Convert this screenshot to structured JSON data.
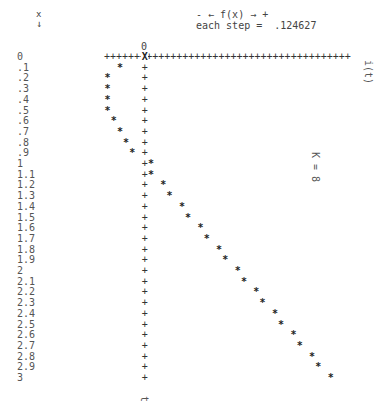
{
  "header": {
    "x_label": "x",
    "x_arrow": "↓",
    "direction_legend": "- ← f(x) → +",
    "step_text": "each step =  .124627"
  },
  "axis": {
    "zero_label": "0",
    "axis_line": "+++++++++++++++++++++++++++++++++++++++++",
    "right_label": "i(t)",
    "bottom_label": "t",
    "param_label": "K = 8"
  },
  "chart_data": {
    "type": "scatter",
    "title": "",
    "xlabel": "x (t)",
    "ylabel": "f(x) = i(t)",
    "step": 0.124627,
    "param": "K = 8",
    "orientation": "x vertical (down), f(x) horizontal (right)",
    "x": [
      0,
      0.1,
      0.2,
      0.3,
      0.4,
      0.5,
      0.6,
      0.7,
      0.8,
      0.9,
      1,
      1.1,
      1.2,
      1.3,
      1.4,
      1.5,
      1.6,
      1.7,
      1.8,
      1.9,
      2,
      2.1,
      2.2,
      2.3,
      2.4,
      2.5,
      2.6,
      2.7,
      2.8,
      2.9,
      3
    ],
    "x_labels": [
      "0",
      ".1",
      ".2",
      ".3",
      ".4",
      ".5",
      ".6",
      ".7",
      ".8",
      ".9",
      "1",
      "1.1",
      "1.2",
      "1.3",
      "1.4",
      "1.5",
      "1.6",
      "1.7",
      "1.8",
      "1.9",
      "2",
      "2.1",
      "2.2",
      "2.3",
      "2.4",
      "2.5",
      "2.6",
      "2.7",
      "2.8",
      "2.9",
      "3"
    ],
    "steps_from_axis": [
      0,
      -4,
      -6,
      -6,
      -6,
      -6,
      -5,
      -4,
      -3,
      -2,
      1,
      1,
      3,
      4,
      6,
      7,
      9,
      10,
      12,
      13,
      15,
      16,
      18,
      19,
      21,
      22,
      24,
      25,
      27,
      28,
      30
    ],
    "values": [
      0,
      -0.4985,
      -0.7478,
      -0.7478,
      -0.7478,
      -0.7478,
      -0.6231,
      -0.4985,
      -0.3739,
      -0.2493,
      0.1246,
      0.1246,
      0.3739,
      0.4985,
      0.7478,
      0.8724,
      1.1216,
      1.2463,
      1.4955,
      1.6202,
      1.8694,
      1.994,
      2.2433,
      2.3679,
      2.6172,
      2.7418,
      2.991,
      3.1157,
      3.3649,
      3.4896,
      3.7388
    ],
    "grid": false,
    "legend": null
  }
}
